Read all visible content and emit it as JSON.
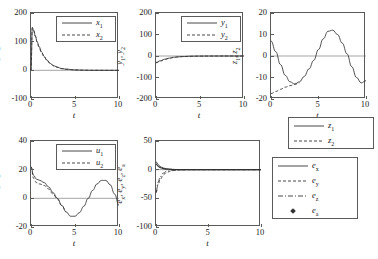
{
  "figure": {
    "kind": "multi-panel-line-plot",
    "panels": 5,
    "background": "#ffffff",
    "line_color": "#333333"
  },
  "chart_data": [
    {
      "id": "panel-1",
      "type": "line",
      "title": "",
      "xlabel": "t",
      "ylabel": "x1, x2",
      "ylabel_parts": [
        "x",
        "1",
        "x",
        "2"
      ],
      "xlim": [
        0,
        10
      ],
      "ylim": [
        -100,
        200
      ],
      "xticks": [
        0,
        5,
        10
      ],
      "xticklabels": [
        "0",
        "5",
        "10"
      ],
      "yticks": [
        -100,
        0,
        100,
        200
      ],
      "yticklabels": [
        "-100",
        "0",
        "100",
        "200"
      ],
      "grid": false,
      "legend_position": "upper right inside",
      "series": [
        {
          "name": "x1",
          "label": "x1",
          "style": "solid",
          "x": [
            0,
            0.15,
            0.3,
            0.5,
            0.7,
            0.9,
            1.2,
            1.5,
            1.8,
            2.2,
            2.6,
            3.0,
            3.5,
            4.0,
            5.0,
            6.0,
            7.0,
            8.0,
            9.0,
            10.0
          ],
          "values": [
            0,
            150,
            140,
            120,
            100,
            84,
            64,
            48,
            36,
            24,
            16,
            11,
            6,
            4,
            1.5,
            0.6,
            0.2,
            0.1,
            0.05,
            0
          ]
        },
        {
          "name": "x2",
          "label": "x2",
          "style": "dashed",
          "x": [
            0,
            0.15,
            0.3,
            0.5,
            0.7,
            0.9,
            1.2,
            1.5,
            1.8,
            2.2,
            2.6,
            3.0,
            3.5,
            4.0,
            5.0,
            6.0,
            7.0,
            8.0,
            9.0,
            10.0
          ],
          "values": [
            0,
            148,
            138,
            118,
            98,
            82,
            62,
            47,
            35,
            23,
            15,
            10.5,
            5.8,
            3.8,
            1.4,
            0.55,
            0.2,
            0.1,
            0.05,
            0
          ]
        }
      ]
    },
    {
      "id": "panel-2",
      "type": "line",
      "title": "",
      "xlabel": "t",
      "ylabel": "y1, y2",
      "ylabel_parts": [
        "y",
        "1",
        "y",
        "2"
      ],
      "xlim": [
        0,
        10
      ],
      "ylim": [
        -200,
        200
      ],
      "xticks": [
        0,
        5,
        10
      ],
      "xticklabels": [
        "0",
        "5",
        "10"
      ],
      "yticks": [
        -200,
        -100,
        0,
        100,
        200
      ],
      "yticklabels": [
        "-200",
        "-100",
        "0",
        "100",
        "200"
      ],
      "grid": false,
      "legend_position": "upper right inside",
      "series": [
        {
          "name": "y1",
          "label": "y1",
          "style": "solid",
          "x": [
            0,
            0.5,
            1.0,
            1.5,
            2.0,
            2.5,
            3.0,
            4.0,
            5.0,
            6.0,
            7.0,
            8.0,
            9.0,
            10.0
          ],
          "values": [
            -30,
            -22,
            -15,
            -10,
            -6,
            -4,
            -2.5,
            -1,
            -0.4,
            -0.2,
            -0.1,
            0,
            0,
            0
          ]
        },
        {
          "name": "y2",
          "label": "y2",
          "style": "dashed",
          "x": [
            0,
            0.5,
            1.0,
            1.5,
            2.0,
            2.5,
            3.0,
            4.0,
            5.0,
            6.0,
            7.0,
            8.0,
            9.0,
            10.0
          ],
          "values": [
            -32,
            -24,
            -16,
            -11,
            -7,
            -4.5,
            -3,
            -1.2,
            -0.5,
            -0.25,
            -0.1,
            0,
            0,
            0
          ]
        }
      ]
    },
    {
      "id": "panel-3",
      "type": "line",
      "title": "",
      "xlabel": "t",
      "ylabel": "z1, z2",
      "ylabel_parts": [
        "z",
        "1",
        "z",
        "2"
      ],
      "xlim": [
        0,
        10
      ],
      "ylim": [
        -20,
        20
      ],
      "xticks": [
        0,
        5,
        10
      ],
      "xticklabels": [
        "0",
        "5",
        "10"
      ],
      "yticks": [
        -20,
        -10,
        0,
        10,
        20
      ],
      "yticklabels": [
        "-20",
        "-10",
        "0",
        "10",
        "20"
      ],
      "grid": false,
      "legend_position": "below right outside",
      "series": [
        {
          "name": "z1",
          "label": "z1",
          "style": "solid",
          "x": [
            0,
            0.5,
            1.0,
            1.5,
            2.0,
            2.5,
            3.0,
            3.5,
            4.0,
            4.5,
            5.0,
            5.5,
            6.0,
            6.5,
            7.0,
            7.5,
            8.0,
            8.5,
            9.0,
            9.5,
            10.0
          ],
          "values": [
            7,
            2,
            -4,
            -9,
            -12,
            -13,
            -12,
            -9.5,
            -6,
            -2,
            3,
            8,
            11.5,
            12,
            10,
            6,
            1,
            -5,
            -10,
            -12.5,
            -11.5
          ]
        },
        {
          "name": "z2",
          "label": "z2",
          "style": "dashed",
          "x": [
            0,
            0.5,
            1.0,
            1.5,
            2.0,
            2.5,
            3.0
          ],
          "values": [
            -17.5,
            -16.5,
            -15.5,
            -14.5,
            -13.8,
            -13.2,
            -12.5
          ]
        }
      ]
    },
    {
      "id": "panel-4",
      "type": "line",
      "title": "",
      "xlabel": "t",
      "ylabel": "u1, u2",
      "ylabel_parts": [
        "u",
        "1",
        "u",
        "2"
      ],
      "xlim": [
        0,
        10
      ],
      "ylim": [
        -20,
        40
      ],
      "xticks": [
        0,
        5,
        10
      ],
      "xticklabels": [
        "0",
        "5",
        "10"
      ],
      "yticks": [
        -20,
        0,
        20,
        40
      ],
      "yticklabels": [
        "-20",
        "0",
        "20",
        "40"
      ],
      "grid": false,
      "legend_position": "upper right inside",
      "series": [
        {
          "name": "u1",
          "label": "u1",
          "style": "solid",
          "x": [
            0,
            0.3,
            0.6,
            1.0,
            1.5,
            2.0,
            2.5,
            3.0,
            3.5,
            4.0,
            4.5,
            5.0,
            5.5,
            6.0,
            6.5,
            7.0,
            7.5,
            8.0,
            8.5,
            9.0,
            9.5,
            10.0
          ],
          "values": [
            22,
            16,
            13.5,
            12.5,
            11,
            8,
            4,
            0,
            -5,
            -9.5,
            -12.5,
            -12.5,
            -10,
            -5.5,
            0,
            5.5,
            10,
            12.5,
            12.5,
            9.5,
            3,
            -5
          ]
        },
        {
          "name": "u2",
          "label": "u2",
          "style": "dashed",
          "x": [
            0,
            0.3,
            0.6,
            1.0,
            1.5,
            2.0,
            2.5,
            3.0,
            3.5,
            4.0
          ],
          "values": [
            22,
            14,
            11,
            10,
            9,
            6.5,
            3,
            -0.5,
            -5,
            -9.5
          ]
        }
      ]
    },
    {
      "id": "panel-5",
      "type": "line",
      "title": "",
      "xlabel": "t",
      "ylabel": "ex, ey, ez, ea",
      "ylabel_parts": [
        "e",
        "x",
        "e",
        "y",
        "e",
        "z",
        "e",
        "a"
      ],
      "xlim": [
        0,
        10
      ],
      "ylim": [
        -100,
        50
      ],
      "xticks": [
        0,
        5,
        10
      ],
      "xticklabels": [
        "0",
        "5",
        "10"
      ],
      "yticks": [
        -100,
        -50,
        0,
        50
      ],
      "yticklabels": [
        "-100",
        "-50",
        "0",
        "50"
      ],
      "grid": false,
      "legend_position": "right outside",
      "series": [
        {
          "name": "ex",
          "label": "ex",
          "style": "solid",
          "x": [
            0,
            0.2,
            0.4,
            0.7,
            1.0,
            1.4,
            1.8,
            2.2,
            2.6,
            3.0,
            4.0,
            5.0,
            6.0,
            7.0,
            8.0,
            9.0,
            10.0
          ],
          "values": [
            14,
            9,
            5.5,
            3,
            1.6,
            0.8,
            0.4,
            0.2,
            0.1,
            0,
            0,
            0,
            0,
            0,
            0,
            0,
            0
          ]
        },
        {
          "name": "ey",
          "label": "ey",
          "style": "dashed",
          "x": [
            0,
            0.2,
            0.4,
            0.7,
            1.0,
            1.4,
            1.8,
            2.2,
            2.6,
            3.0,
            4.0,
            5.0,
            6.0,
            7.0,
            8.0,
            9.0,
            10.0
          ],
          "values": [
            -40,
            -26,
            -17,
            -9,
            -5,
            -2.4,
            -1.2,
            -0.6,
            -0.3,
            -0.1,
            0,
            0,
            0,
            0,
            0,
            0,
            0
          ]
        },
        {
          "name": "ez",
          "label": "ez",
          "style": "dashdot",
          "x": [
            0,
            0.2,
            0.4,
            0.7,
            1.0,
            1.4,
            1.8,
            2.2,
            2.6,
            3.0,
            4.0,
            5.0,
            6.0,
            7.0,
            8.0,
            9.0,
            10.0
          ],
          "values": [
            -40,
            -22,
            -12,
            -6,
            -3,
            -1.4,
            -0.7,
            -0.3,
            -0.1,
            0,
            0,
            0,
            0,
            0,
            0,
            0,
            0
          ]
        },
        {
          "name": "ea",
          "label": "ea",
          "style": "marker-diamond",
          "x": [
            0,
            0.2,
            0.4,
            0.7,
            1.0,
            1.4,
            1.8,
            2.2,
            2.6,
            3.0,
            4.0,
            5.0,
            6.0,
            7.0,
            8.0,
            9.0,
            10.0
          ],
          "values": [
            10,
            6,
            3.5,
            1.8,
            1.0,
            0.5,
            0.2,
            0.1,
            0,
            0,
            0,
            0,
            0,
            0,
            0,
            0,
            0
          ]
        }
      ]
    }
  ],
  "legends": {
    "panel1": [
      {
        "label_base": "x",
        "label_sub": "1",
        "style": "solid"
      },
      {
        "label_base": "x",
        "label_sub": "2",
        "style": "dashed"
      }
    ],
    "panel2": [
      {
        "label_base": "y",
        "label_sub": "1",
        "style": "solid"
      },
      {
        "label_base": "y",
        "label_sub": "2",
        "style": "dashed"
      }
    ],
    "panel3": [
      {
        "label_base": "z",
        "label_sub": "1",
        "style": "solid"
      },
      {
        "label_base": "z",
        "label_sub": "2",
        "style": "dashed"
      }
    ],
    "panel4": [
      {
        "label_base": "u",
        "label_sub": "1",
        "style": "solid"
      },
      {
        "label_base": "u",
        "label_sub": "2",
        "style": "dashed"
      }
    ],
    "panel5": [
      {
        "label_base": "e",
        "label_sub": "x",
        "style": "solid"
      },
      {
        "label_base": "e",
        "label_sub": "y",
        "style": "dashed"
      },
      {
        "label_base": "e",
        "label_sub": "z",
        "style": "dashdot"
      },
      {
        "label_base": "e",
        "label_sub": "a",
        "style": "marker-diamond"
      }
    ]
  }
}
